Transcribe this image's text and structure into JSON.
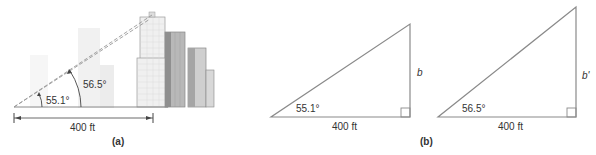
{
  "figure_a": {
    "caption": "(a)",
    "angle_small": "55.1°",
    "angle_large": "56.5°",
    "distance": "400 ft"
  },
  "figure_b": {
    "caption": "(b)",
    "triangle_1": {
      "angle": "55.1°",
      "base": "400 ft",
      "side_label": "b"
    },
    "triangle_2": {
      "angle": "56.5°",
      "base": "400 ft",
      "side_label": "b'"
    }
  },
  "colors": {
    "line": "#8a8a8a",
    "building_light": "#e6e6e6",
    "building_mid": "#bdbdbd",
    "building_dark": "#8c8c8c",
    "ghost": "#f0f0f0"
  }
}
